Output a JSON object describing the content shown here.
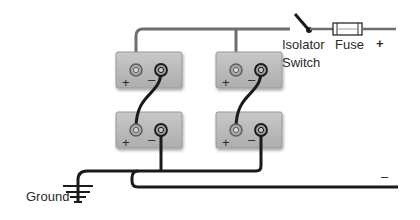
{
  "diagram": {
    "labels": {
      "isolator_line1": "Isolator",
      "isolator_line2": "Switch",
      "fuse": "Fuse",
      "positive_output": "+",
      "negative_output": "–",
      "ground": "Ground"
    },
    "batteries": [
      {
        "id": "top-left",
        "plus": "+",
        "minus": "–"
      },
      {
        "id": "top-right",
        "plus": "+",
        "minus": "–"
      },
      {
        "id": "bottom-left",
        "plus": "+",
        "minus": "–"
      },
      {
        "id": "bottom-right",
        "plus": "+",
        "minus": "–"
      }
    ],
    "colors": {
      "battery_fill": "#b9b9b9",
      "battery_edge": "#9a9a9a",
      "positive_wire": "#6e6e6e",
      "negative_wire": "#1a1a1a",
      "background": "#ffffff"
    }
  }
}
